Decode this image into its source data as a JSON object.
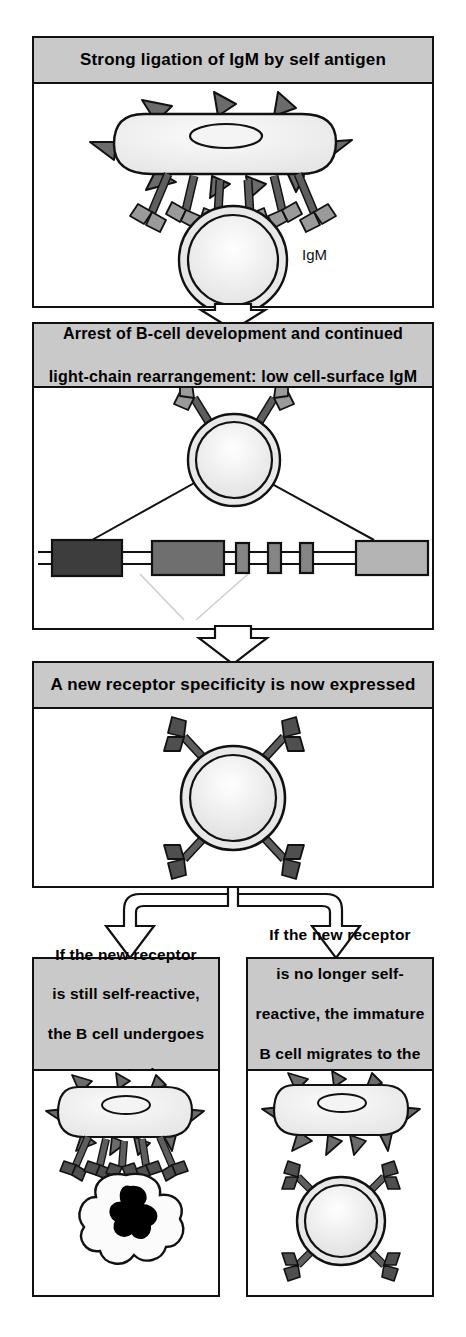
{
  "figure": {
    "colors": {
      "header_gray": "#c9c9c9",
      "outline": "#111111",
      "cell_fill": "#ececec",
      "receptor_stem": "#5e5e5e",
      "receptor_arm": "#9a9a9a",
      "spike": "#6b6b6b",
      "gene_v_dark": "#3d3d3d",
      "gene_v_mid": "#6f6f6f",
      "gene_j_small": "#858585",
      "gene_c_light": "#b4b4b4",
      "apoptotic_nucleus": "#000000",
      "background": "#ffffff"
    }
  },
  "panels": [
    {
      "id": "panel-1",
      "header": "Strong ligation of IgM by self antigen",
      "labels": [
        "IgM"
      ],
      "illustration": "antigen-presenting-cell-bound-to-immature-B-cell-via-many-IgM-receptors"
    },
    {
      "id": "panel-2",
      "header_line_1": "Arrest of B-cell development and continued",
      "header_line_2": "light-chain rearrangement: low cell-surface IgM",
      "illustration": "B-cell-with-two-IgM-receptors-above-light-chain-gene-locus-diagram"
    },
    {
      "id": "panel-3",
      "header": "A new receptor specificity is now expressed",
      "illustration": "B-cell-with-four-new-IgM-receptors"
    },
    {
      "id": "panel-4",
      "header_line_1": "If the new receptor",
      "header_line_2": "is still self-reactive,",
      "header_line_3": "the B cell undergoes",
      "header_line_4": "apoptosis",
      "illustration": "antigen-cell-bound-to-apoptotic-B-cell-with-condensed-nucleus"
    },
    {
      "id": "panel-5",
      "header_line_1": "If the new receptor",
      "header_line_2": "is no longer self-",
      "header_line_3": "reactive, the immature",
      "header_line_4": "B cell migrates to the",
      "header_line_5": "periphery and matures",
      "illustration": "antigen-cell-unbound-above-healthy-immature-B-cell"
    }
  ],
  "connectors": [
    {
      "name": "arrow-panel1-to-panel2",
      "shape": "down-arrow"
    },
    {
      "name": "arrow-panel2-to-panel3",
      "shape": "down-arrow"
    },
    {
      "name": "arrow-fork-panel3-to-panel4-and-panel5",
      "shape": "forked-down-arrow"
    }
  ],
  "gene_locus": {
    "name": "light-chain-gene-locus",
    "segments": [
      {
        "name": "v-segment-dark",
        "shade": "#3d3d3d",
        "x": 14,
        "width": 54,
        "height": 30
      },
      {
        "name": "v-segment-mid",
        "shade": "#6f6f6f",
        "x": 104,
        "width": 56,
        "height": 28
      },
      {
        "name": "j-segment-1",
        "shade": "#858585",
        "x": 176,
        "width": 10,
        "height": 24
      },
      {
        "name": "j-segment-2",
        "shade": "#858585",
        "x": 204,
        "width": 10,
        "height": 24
      },
      {
        "name": "j-segment-3",
        "shade": "#858585",
        "x": 232,
        "width": 10,
        "height": 24
      },
      {
        "name": "c-segment-light",
        "shade": "#b4b4b4",
        "x": 286,
        "width": 62,
        "height": 28
      }
    ]
  }
}
